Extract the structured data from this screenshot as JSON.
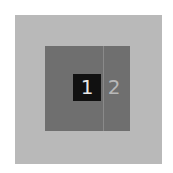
{
  "tiles": {
    "selected": {
      "label": "1"
    },
    "next": {
      "label": "2"
    }
  },
  "colors": {
    "outer": "#b9b9b9",
    "inner": "#6f6f6f",
    "selected_bg": "#111111",
    "selected_text": "#e8e8e8",
    "next_text": "#b8b8b8"
  }
}
